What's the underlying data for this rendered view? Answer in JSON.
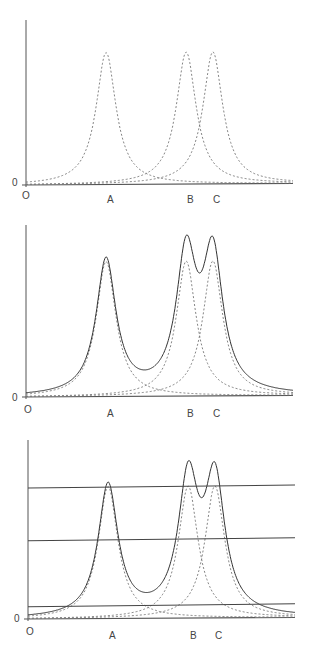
{
  "figure": {
    "panels": [
      {
        "id": "panel-1",
        "description": "Individual peaks only (dashed)",
        "y_zero_label": "0",
        "origin_label": "O",
        "peak_labels": [
          "A",
          "B",
          "C"
        ],
        "show_sum": false,
        "threshold_lines": []
      },
      {
        "id": "panel-2",
        "description": "Individual peaks (dashed) with summed envelope (solid)",
        "y_zero_label": "0",
        "origin_label": "O",
        "peak_labels": [
          "A",
          "B",
          "C"
        ],
        "show_sum": true,
        "threshold_lines": []
      },
      {
        "id": "panel-3",
        "description": "Individual peaks, summed envelope and three horizontal threshold lines",
        "y_zero_label": "0",
        "origin_label": "O",
        "peak_labels": [
          "A",
          "B",
          "C"
        ],
        "show_sum": true,
        "threshold_lines": [
          "high",
          "middle",
          "low"
        ]
      }
    ],
    "colors": {
      "axis": "#555555",
      "dashed_peak": "#777777",
      "sum_curve": "#333333",
      "threshold_line": "#444444",
      "label": "#444444"
    }
  },
  "chart_data": {
    "type": "line",
    "title": "",
    "xlabel": "",
    "ylabel": "",
    "x_tick_labels": [
      "O",
      "A",
      "B",
      "C"
    ],
    "y_tick_labels": [
      "0"
    ],
    "peaks": [
      {
        "name": "A",
        "position": 0.3,
        "height": 1.0,
        "shape": "lorentzian"
      },
      {
        "name": "B",
        "position": 0.6,
        "height": 1.0,
        "shape": "lorentzian"
      },
      {
        "name": "C",
        "position": 0.7,
        "height": 1.0,
        "shape": "lorentzian"
      }
    ],
    "panels": [
      {
        "series": [
          "A (dashed)",
          "B (dashed)",
          "C (dashed)"
        ]
      },
      {
        "series": [
          "A (dashed)",
          "B (dashed)",
          "C (dashed)",
          "Sum (solid)"
        ]
      },
      {
        "series": [
          "A (dashed)",
          "B (dashed)",
          "C (dashed)",
          "Sum (solid)"
        ],
        "horizontal_lines_relative_height": [
          1.0,
          0.6,
          0.1
        ]
      }
    ]
  }
}
